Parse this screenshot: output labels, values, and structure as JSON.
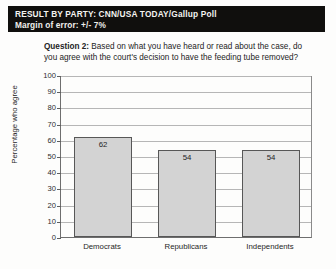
{
  "header": {
    "title": "RESULT BY PARTY: CNN/USA TODAY/Gallup Poll",
    "subtitle": "Margin of error: +/- 7%"
  },
  "question": {
    "label": "Question 2:",
    "text": " Based on what you have heard or read about the case, do you agree with the court's decision to have the feeding tube removed?"
  },
  "colors": {
    "header_background": "#100f0d",
    "header_text": "#f4f3f0",
    "bar_fill": "#d3d3d3",
    "bar_border": "#575757",
    "gridline": "#b6b6b6",
    "page_background": "#fdfdfc"
  },
  "chart_data": {
    "type": "bar",
    "title": "RESULT BY PARTY: CNN/USA TODAY/Gallup Poll",
    "subtitle": "Margin of error: +/- 7%",
    "categories": [
      "Democrats",
      "Republicans",
      "Independents"
    ],
    "values": [
      62,
      54,
      54
    ],
    "xlabel": "",
    "ylabel": "Percentage who agree",
    "ylim": [
      0,
      100
    ],
    "ytick_labels": [
      "0",
      "10",
      "20",
      "30",
      "40",
      "50",
      "60",
      "70",
      "80",
      "90",
      "100"
    ],
    "ytick_values": [
      0,
      10,
      20,
      30,
      40,
      50,
      60,
      70,
      80,
      90,
      100
    ],
    "grid": true,
    "legend": false,
    "data_labels": [
      "62",
      "54",
      "54"
    ]
  }
}
